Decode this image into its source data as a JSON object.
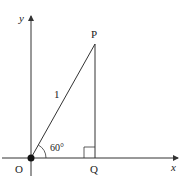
{
  "diagram": {
    "axes": {
      "x_label": "x",
      "y_label": "y"
    },
    "points": {
      "origin": "O",
      "top": "P",
      "foot": "Q"
    },
    "hypotenuse_label": "1",
    "angle_label": "60°",
    "colors": {
      "line": "#333333",
      "background": "#ffffff"
    }
  }
}
